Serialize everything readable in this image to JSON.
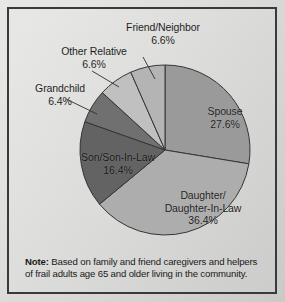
{
  "figure": {
    "background_color": "#dcdcda",
    "border_color": "#3a3a3a",
    "note_prefix": "Note:",
    "note_text": "Based on family and friend caregivers and helpers of frail adults age 65 and older living in the community."
  },
  "labels": {
    "spouse_name": "Spouse",
    "spouse_pct": "27.6%",
    "daughter_name_line1": "Daughter/",
    "daughter_name_line2": "Daughter-In-Law",
    "daughter_pct": "36.4%",
    "son_name": "Son/Son-In-Law",
    "son_pct": "16.4%",
    "grandchild_name": "Grandchild",
    "grandchild_pct": "6.4%",
    "other_name": "Other Relative",
    "other_pct": "6.6%",
    "friend_name": "Friend/Neighbor",
    "friend_pct": "6.6%"
  },
  "chart_data": {
    "type": "pie",
    "title": "",
    "subtitle": "",
    "xlabel": "",
    "ylabel": "",
    "grid": false,
    "legend_position": "none",
    "label_placement": "inside-and-leader-lines",
    "start_angle_deg": 0,
    "direction": "clockwise",
    "units": "percent",
    "total": 100.0,
    "center_px": [
      163,
      148
    ],
    "radius_px": 85,
    "categories": [
      "Spouse",
      "Daughter/Daughter-In-Law",
      "Son/Son-In-Law",
      "Grandchild",
      "Other Relative",
      "Friend/Neighbor"
    ],
    "values": [
      27.6,
      36.4,
      16.4,
      6.4,
      6.6,
      6.6
    ],
    "value_labels": [
      "27.6%",
      "36.4%",
      "16.4%",
      "6.4%",
      "6.6%",
      "6.6%"
    ],
    "colors": [
      "#9a9a9a",
      "#adadad",
      "#636363",
      "#707070",
      "#c0c0c0",
      "#b4b4b4"
    ],
    "slice_outline_color": "#343434",
    "annotations": [
      "Note: Based on family and friend caregivers and helpers of frail adults age 65 and older living in the community."
    ]
  }
}
